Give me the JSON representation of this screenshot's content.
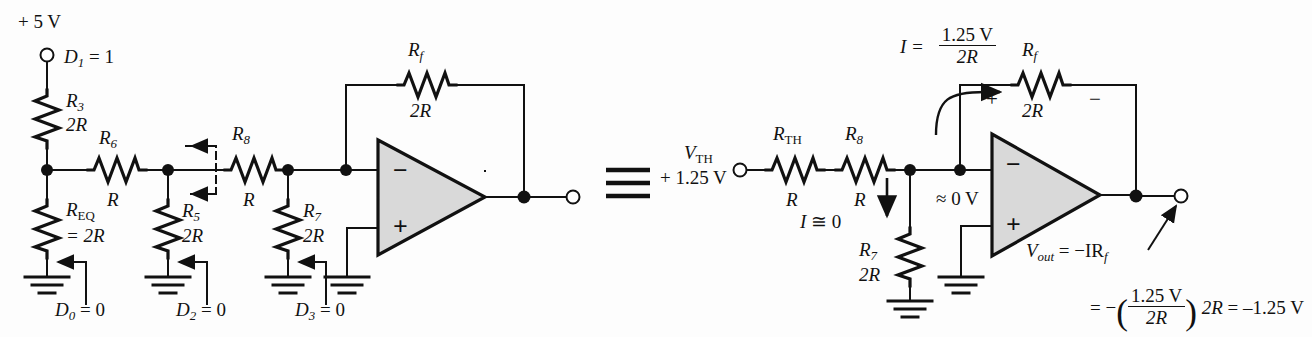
{
  "figure": {
    "type": "circuit-schematic",
    "equivalence_symbol": "≡"
  },
  "left_circuit": {
    "supply_label": "+ 5 V",
    "supply_terminal": "open-circle",
    "d1": {
      "name": "D",
      "index": "1",
      "eq": "= 1"
    },
    "r3": {
      "name": "R",
      "index": "3",
      "value": "2R"
    },
    "req": {
      "name": "R",
      "index": "EQ",
      "value": "= 2R"
    },
    "r6": {
      "name": "R",
      "index": "6",
      "value": "R"
    },
    "r5": {
      "name": "R",
      "index": "5",
      "value": "2R"
    },
    "r8": {
      "name": "R",
      "index": "8",
      "value": "R"
    },
    "r7": {
      "name": "R",
      "index": "7",
      "value": "2R"
    },
    "rf": {
      "name": "R",
      "index": "f",
      "value": "2R"
    },
    "d0": {
      "name": "D",
      "index": "0",
      "eq": "= 0"
    },
    "d2": {
      "name": "D",
      "index": "2",
      "eq": "= 0"
    },
    "d3": {
      "name": "D",
      "index": "3",
      "eq": "= 0"
    },
    "opamp_minus": "−",
    "opamp_plus": "+"
  },
  "right_circuit": {
    "vth_name": "V",
    "vth_sub": "TH",
    "vth_value": "+ 1.25 V",
    "rth": {
      "name": "R",
      "index": "TH",
      "value": "R"
    },
    "r8": {
      "name": "R",
      "index": "8",
      "value": "R"
    },
    "r7": {
      "name": "R",
      "index": "7",
      "value": "2R"
    },
    "rf": {
      "name": "R",
      "index": "f",
      "value": "2R"
    },
    "current_eq_lhs": "I  =",
    "current_eq_num": "1.25 V",
    "current_eq_den": "2R",
    "i_zero": "I ≅ 0",
    "virtual_ground": "≈ 0 V",
    "rf_polarity_plus": "+",
    "rf_polarity_minus": "−",
    "opamp_minus": "−",
    "opamp_plus": "+",
    "vout_name": "V",
    "vout_sub": "out",
    "vout_eq1": "=  −IR",
    "vout_eq1_sub": "f",
    "vout_eq2_lead": "=  −",
    "vout_eq2_num": "1.25 V",
    "vout_eq2_den": "2R",
    "vout_eq2_tail": "2R = –1.25 V"
  },
  "colors": {
    "wire": "#111111",
    "opamp_fill": "#d9d9d9",
    "background": "#fdfdfd"
  }
}
